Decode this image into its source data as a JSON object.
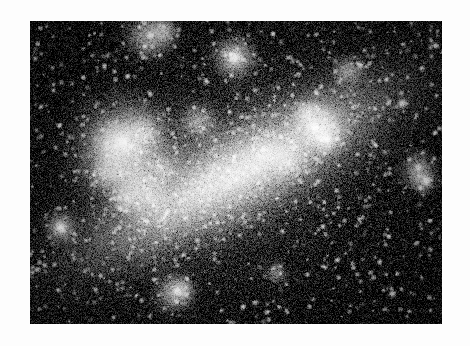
{
  "page": {
    "width": 470,
    "height": 346,
    "background_color": "#fdfdfd",
    "title": "Astronomical plate — barred irregular galaxy"
  },
  "plate": {
    "x": 30,
    "y": 21,
    "width": 412,
    "height": 303,
    "sky_color": "#050505",
    "highlight_color": "#ffffff",
    "border_color": "#fdfdfd",
    "medium": "grayscale photographic negative print",
    "grain": "heavy film grain",
    "alt_text": "Grayscale telescope photograph of a barred irregular (Magellanic type) galaxy. A bright elongated bar of stars runs diagonally from lower left to upper right across a dark star-speckled sky, with a prominent star-forming complex at the left end of the bar and bright knots along the upper right."
  },
  "image_content": {
    "object_type": "barred irregular galaxy",
    "features": [
      {
        "name": "central-bar",
        "label": "Central stellar bar",
        "cx": 206,
        "cy": 152,
        "angle_deg": -28
      },
      {
        "name": "hii-complex-left",
        "label": "Bright star-forming complex",
        "cx": 96,
        "cy": 128
      },
      {
        "name": "knot-upper-right",
        "label": "Bright knots",
        "cx": 288,
        "cy": 104
      },
      {
        "name": "outer-halo",
        "label": "Diffuse outer halo"
      },
      {
        "name": "foreground-stars",
        "label": "Foreground stars"
      }
    ]
  },
  "chart_data": {
    "type": "scatter",
    "title": "Barred irregular galaxy — surface brightness field",
    "xlabel": "",
    "ylabel": "",
    "grid": false,
    "legend": "none",
    "xlim": [
      0,
      412
    ],
    "ylim": [
      0,
      303
    ],
    "bar": {
      "cx": 206,
      "cy": 152,
      "length": 260,
      "width": 70,
      "angle_deg": -28,
      "peak": 0.95
    },
    "halo": {
      "cx": 210,
      "cy": 150,
      "rx": 190,
      "ry": 120,
      "angle_deg": -28,
      "peak": 0.3
    },
    "blobs": [
      {
        "x": 96,
        "y": 128,
        "r": 26,
        "b": 0.8
      },
      {
        "x": 88,
        "y": 122,
        "r": 12,
        "b": 0.95
      },
      {
        "x": 78,
        "y": 150,
        "r": 10,
        "b": 0.55
      },
      {
        "x": 104,
        "y": 160,
        "r": 12,
        "b": 0.5
      },
      {
        "x": 120,
        "y": 176,
        "r": 11,
        "b": 0.45
      },
      {
        "x": 96,
        "y": 178,
        "r": 8,
        "b": 0.55
      },
      {
        "x": 112,
        "y": 110,
        "r": 9,
        "b": 0.5
      },
      {
        "x": 132,
        "y": 148,
        "r": 8,
        "b": 0.4
      },
      {
        "x": 168,
        "y": 100,
        "r": 10,
        "b": 0.45
      },
      {
        "x": 204,
        "y": 36,
        "r": 11,
        "b": 0.72
      },
      {
        "x": 118,
        "y": 14,
        "r": 12,
        "b": 0.62
      },
      {
        "x": 134,
        "y": 10,
        "r": 7,
        "b": 0.55
      },
      {
        "x": 288,
        "y": 104,
        "r": 12,
        "b": 0.85
      },
      {
        "x": 296,
        "y": 116,
        "r": 9,
        "b": 0.7
      },
      {
        "x": 276,
        "y": 92,
        "r": 7,
        "b": 0.55
      },
      {
        "x": 318,
        "y": 50,
        "r": 8,
        "b": 0.48
      },
      {
        "x": 258,
        "y": 140,
        "r": 9,
        "b": 0.45
      },
      {
        "x": 236,
        "y": 132,
        "r": 8,
        "b": 0.4
      },
      {
        "x": 388,
        "y": 148,
        "r": 9,
        "b": 0.5
      },
      {
        "x": 392,
        "y": 160,
        "r": 7,
        "b": 0.45
      },
      {
        "x": 144,
        "y": 272,
        "r": 10,
        "b": 0.6
      },
      {
        "x": 152,
        "y": 268,
        "r": 6,
        "b": 0.5
      },
      {
        "x": 30,
        "y": 206,
        "r": 8,
        "b": 0.62
      },
      {
        "x": 246,
        "y": 252,
        "r": 6,
        "b": 0.35
      }
    ],
    "stars": [
      {
        "x": 204,
        "y": 36,
        "r": 3.4,
        "b": 1.0
      },
      {
        "x": 372,
        "y": 82,
        "r": 2.4,
        "b": 0.95
      },
      {
        "x": 330,
        "y": 44,
        "r": 1.8,
        "b": 0.8
      },
      {
        "x": 362,
        "y": 272,
        "r": 2.0,
        "b": 0.8
      },
      {
        "x": 30,
        "y": 206,
        "r": 2.6,
        "b": 0.92
      },
      {
        "x": 396,
        "y": 160,
        "r": 2.2,
        "b": 0.88
      },
      {
        "x": 284,
        "y": 106,
        "r": 2.6,
        "b": 1.0
      },
      {
        "x": 296,
        "y": 118,
        "r": 2.2,
        "b": 0.92
      },
      {
        "x": 120,
        "y": 14,
        "r": 2.2,
        "b": 0.78
      },
      {
        "x": 176,
        "y": 60,
        "r": 1.6,
        "b": 0.7
      },
      {
        "x": 404,
        "y": 24,
        "r": 1.6,
        "b": 0.7
      },
      {
        "x": 356,
        "y": 58,
        "r": 1.5,
        "b": 0.66
      },
      {
        "x": 252,
        "y": 210,
        "r": 1.5,
        "b": 0.62
      },
      {
        "x": 146,
        "y": 270,
        "r": 2.0,
        "b": 0.82
      },
      {
        "x": 70,
        "y": 254,
        "r": 1.4,
        "b": 0.58
      },
      {
        "x": 212,
        "y": 286,
        "r": 1.4,
        "b": 0.58
      },
      {
        "x": 332,
        "y": 196,
        "r": 1.4,
        "b": 0.58
      },
      {
        "x": 388,
        "y": 146,
        "r": 1.8,
        "b": 0.74
      },
      {
        "x": 92,
        "y": 120,
        "r": 3.0,
        "b": 1.0
      },
      {
        "x": 62,
        "y": 34,
        "r": 1.3,
        "b": 0.52
      },
      {
        "x": 248,
        "y": 66,
        "r": 1.3,
        "b": 0.52
      },
      {
        "x": 184,
        "y": 232,
        "r": 1.3,
        "b": 0.5
      },
      {
        "x": 308,
        "y": 238,
        "r": 1.3,
        "b": 0.5
      },
      {
        "x": 44,
        "y": 150,
        "r": 1.3,
        "b": 0.5
      },
      {
        "x": 400,
        "y": 228,
        "r": 1.4,
        "b": 0.56
      }
    ],
    "noise": {
      "sigma": 0.085,
      "seed": 20240517
    }
  }
}
